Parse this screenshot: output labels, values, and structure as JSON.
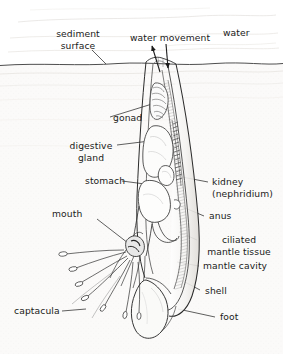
{
  "figure": {
    "type": "biological-diagram",
    "background_color": "#ffffff",
    "ink_color": "#1a1a1a",
    "sediment_tint": "#f2f0ec"
  },
  "labels": {
    "sediment_surface_line1": "sediment",
    "sediment_surface_line2": "surface",
    "water_movement": "water movement",
    "water": "water",
    "gonad": "gonad",
    "digestive_line1": "digestive",
    "digestive_line2": "gland",
    "stomach": "stomach",
    "mouth": "mouth",
    "captacula": "captacula",
    "kidney_line1": "kidney",
    "kidney_line2": "(nephridium)",
    "anus": "anus",
    "ciliated_line1": "ciliated",
    "ciliated_line2": "mantle tissue",
    "mantle_cavity": "mantle cavity",
    "shell": "shell",
    "foot": "foot"
  },
  "structures": [
    "sediment surface",
    "water movement",
    "water",
    "gonad",
    "digestive gland",
    "stomach",
    "mouth",
    "captacula",
    "kidney (nephridium)",
    "anus",
    "ciliated mantle tissue",
    "mantle cavity",
    "shell",
    "foot"
  ]
}
